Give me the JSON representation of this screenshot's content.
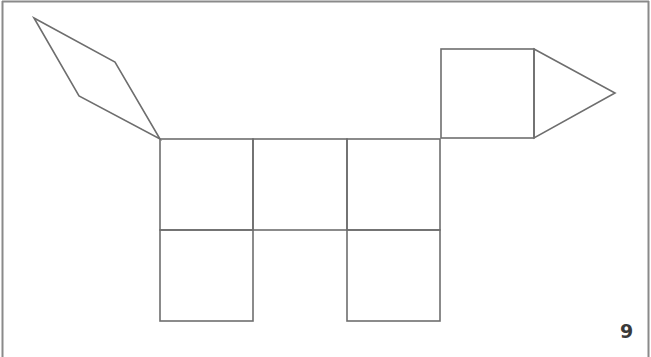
{
  "figure": {
    "stroke_color": "#6e6e6e",
    "frame_color": "#8a8a8a",
    "page_number": "9"
  },
  "shapes": {
    "tail": {
      "type": "rhombus",
      "points": "34,18 115,62 160,139 79,96"
    },
    "head_square": {
      "type": "square",
      "x": 441,
      "y": 49,
      "w": 93,
      "h": 89
    },
    "snout": {
      "type": "triangle",
      "points": "534,49 615,93 534,138"
    },
    "body_squares": [
      {
        "x": 160,
        "y": 139,
        "w": 93,
        "h": 91
      },
      {
        "x": 253,
        "y": 139,
        "w": 94,
        "h": 91
      },
      {
        "x": 347,
        "y": 139,
        "w": 93,
        "h": 91
      }
    ],
    "leg_squares": [
      {
        "x": 160,
        "y": 230,
        "w": 93,
        "h": 91
      },
      {
        "x": 347,
        "y": 230,
        "w": 93,
        "h": 91
      }
    ]
  }
}
